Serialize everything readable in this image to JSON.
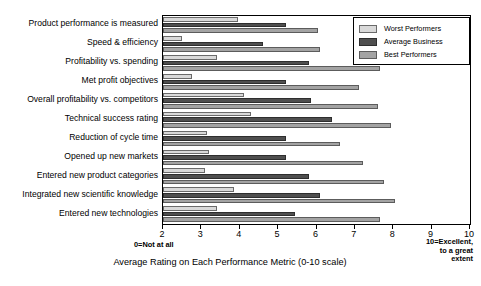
{
  "chart_data": {
    "type": "bar",
    "orientation": "horizontal",
    "title": "",
    "subtitle": "",
    "xlabel": "Average Rating on Each Performance Metric (0-10 scale)",
    "ylabel": "",
    "xlim": [
      2,
      10
    ],
    "xticks": [
      2,
      3,
      4,
      5,
      6,
      7,
      8,
      9,
      10
    ],
    "grid": false,
    "legend_position": "top-right",
    "categories": [
      "Product performance is measured",
      "Speed & efficiency",
      "Profitability vs. spending",
      "Met profit objectives",
      "Overall profitability vs. competitors",
      "Technical success rating",
      "Reduction of cycle time",
      "Opened up new markets",
      "Entered new product categories",
      "Integrated new scientific knowledge",
      "Entered new technologies"
    ],
    "series": [
      {
        "name": "Worst Performers",
        "color": "#d9d9d9",
        "values": [
          3.95,
          2.5,
          3.4,
          2.75,
          4.1,
          4.3,
          3.15,
          3.2,
          3.1,
          3.85,
          3.4
        ]
      },
      {
        "name": "Average Business",
        "color": "#4f4f4f",
        "values": [
          5.2,
          4.6,
          5.8,
          5.2,
          5.85,
          6.4,
          5.2,
          5.2,
          5.8,
          6.1,
          5.45
        ]
      },
      {
        "name": "Best Performers",
        "color": "#a3a3a3",
        "values": [
          6.05,
          6.1,
          7.65,
          7.1,
          7.6,
          7.95,
          6.6,
          7.2,
          7.75,
          8.05,
          7.65
        ]
      }
    ],
    "annotations": {
      "left_scale_note": "0=Not at all",
      "right_scale_note": "10=Excellent,\nto a great\nextent"
    }
  },
  "legend": {
    "items": [
      {
        "label": "Worst Performers",
        "key": "worst"
      },
      {
        "label": "Average Business",
        "key": "avg"
      },
      {
        "label": "Best Performers",
        "key": "best"
      }
    ]
  },
  "annotations": {
    "left_note": "0=Not at all",
    "right_note_line1": "10=Excellent,",
    "right_note_line2": "to a great",
    "right_note_line3": "extent"
  }
}
